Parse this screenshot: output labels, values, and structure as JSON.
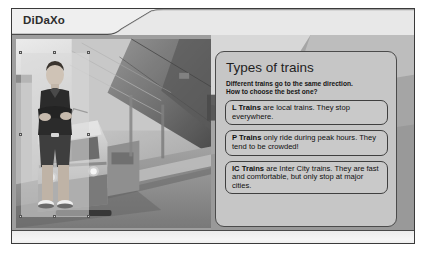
{
  "app": {
    "title": "DiDaXo"
  },
  "slide": {
    "panel": {
      "title": "Types of trains",
      "subtitle_line1": "Different trains go to the same direction.",
      "subtitle_line2": "How to choose the best one?",
      "boxes": [
        {
          "id": "l-trains",
          "label": "L Trains",
          "text": " are local trains. They stop everywhere."
        },
        {
          "id": "p-trains",
          "label": "P Trains",
          "text": " only ride during peak hours. They tend to be crowded!"
        },
        {
          "id": "ic-trains",
          "label": "IC Trains",
          "text": " are Inter City trains. They are fast and comfortable, but only stop at major cities."
        }
      ]
    },
    "media": {
      "presenter_alt": "presenter-standing-arms-crossed",
      "background_alt": "train-at-station-platform"
    }
  },
  "colors": {
    "frame_border": "#3a3a3a",
    "panel_fill": "#c6c6c6",
    "panel_border": "#4b4b4b",
    "header_light": "#f2f2f2",
    "stage_gray": "#9d9d9d",
    "text_dark": "#101010"
  }
}
